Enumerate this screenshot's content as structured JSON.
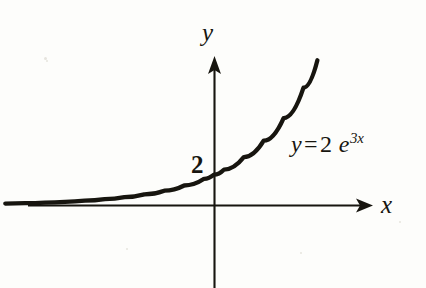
{
  "figure": {
    "title": "",
    "background_color": "#fdfdfb",
    "ink_color": "#17150f",
    "width": 426,
    "height": 288
  },
  "labels": {
    "y_axis": "y",
    "x_axis": "x",
    "y_intercept": "2",
    "equation_variable": "y",
    "equation_operator": "=",
    "equation_coefficient": "2",
    "equation_base": "e",
    "equation_exponent": "3x"
  },
  "chart_data": {
    "type": "line",
    "title": "",
    "xlabel": "x",
    "ylabel": "y",
    "function": "y = 2 e^(3x)",
    "coefficient": 2,
    "rate": 3,
    "y_intercept": 2,
    "annotations": [
      {
        "text": "2",
        "x": 0,
        "y": 2,
        "position": "left-of-y-axis"
      },
      {
        "text": "y = 2 e^3x",
        "x": 0.45,
        "y": 7.7,
        "position": "right-of-curve"
      }
    ],
    "grid": false,
    "legend": null,
    "axes": {
      "x_arrow": true,
      "y_arrow": true,
      "origin_px": [
        214,
        205
      ],
      "xlim": [
        -1.05,
        0.62
      ],
      "ylim": [
        -1.35,
        9.8
      ]
    },
    "x": [
      -1.05,
      -0.95,
      -0.85,
      -0.75,
      -0.65,
      -0.55,
      -0.45,
      -0.35,
      -0.25,
      -0.15,
      -0.05,
      0.0,
      0.05,
      0.15,
      0.25,
      0.35,
      0.45,
      0.52
    ],
    "y": [
      0.09,
      0.12,
      0.16,
      0.21,
      0.28,
      0.38,
      0.52,
      0.7,
      0.94,
      1.28,
      1.72,
      2.0,
      2.32,
      3.14,
      4.23,
      5.71,
      7.71,
      9.51
    ]
  }
}
